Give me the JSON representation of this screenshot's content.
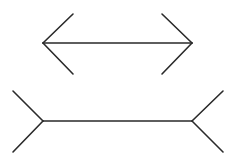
{
  "figure": {
    "name": "Müller-Lyer illusion",
    "stroke_color": "#2a2a2a",
    "background": "#ffffff",
    "top": {
      "shaft": {
        "x1": 43,
        "y1": 43,
        "x2": 192,
        "y2": 43
      },
      "fins": [
        {
          "x1": 43,
          "y1": 43,
          "x2": 73,
          "y2": 14
        },
        {
          "x1": 43,
          "y1": 43,
          "x2": 73,
          "y2": 74
        },
        {
          "x1": 192,
          "y1": 43,
          "x2": 162,
          "y2": 14
        },
        {
          "x1": 192,
          "y1": 43,
          "x2": 162,
          "y2": 74
        }
      ]
    },
    "bottom": {
      "shaft": {
        "x1": 43,
        "y1": 121,
        "x2": 192,
        "y2": 121
      },
      "fins": [
        {
          "x1": 43,
          "y1": 121,
          "x2": 13,
          "y2": 91
        },
        {
          "x1": 43,
          "y1": 121,
          "x2": 13,
          "y2": 152
        },
        {
          "x1": 192,
          "y1": 121,
          "x2": 223,
          "y2": 91
        },
        {
          "x1": 192,
          "y1": 121,
          "x2": 223,
          "y2": 152
        }
      ]
    }
  }
}
